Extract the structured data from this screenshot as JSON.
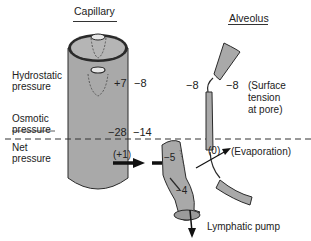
{
  "titles": {
    "capillary": "Capillary",
    "alveolus": "Alveolus"
  },
  "row_labels": {
    "hydrostatic": [
      "Hydrostatic",
      "pressure"
    ],
    "osmotic": [
      "Osmotic",
      "pressure"
    ],
    "net": [
      "Net",
      "pressure"
    ]
  },
  "values": {
    "capillary_hydrostatic": "+7",
    "interstitial_hydrostatic": "−8",
    "capillary_osmotic": "−28",
    "interstitial_osmotic": "−14",
    "net_capillary": "(+1)",
    "lymphatic_upper": "−5",
    "lymphatic_lower": "−4",
    "alveolus_left": "−8",
    "alveolus_right": "−8",
    "alveolus_net": "(0)"
  },
  "annotations": {
    "surface_tension": [
      "(Surface",
      "tension",
      "at pore)"
    ],
    "evaporation": "(Evaporation)",
    "lymphatic_pump": "Lymphatic pump"
  },
  "colors": {
    "vessel_fill": "#a9a9a9",
    "outline": "#2a2a2a",
    "text": "#222222"
  }
}
